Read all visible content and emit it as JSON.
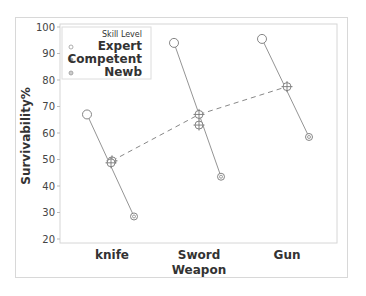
{
  "chart_data": {
    "type": "scatter",
    "title": "",
    "xlabel": "Weapon",
    "ylabel": "Survivability%",
    "ylim": [
      20,
      100
    ],
    "yticks": [
      20,
      30,
      40,
      50,
      60,
      70,
      80,
      90,
      100
    ],
    "categories": [
      "knife",
      "Sword",
      "Gun"
    ],
    "grid": false,
    "legend": {
      "title": "Skill Level",
      "position": "upper-left",
      "entries": [
        "Expert",
        "Competent",
        "Newb"
      ]
    },
    "series": [
      {
        "name": "Expert",
        "marker": "open-circle",
        "values": [
          67,
          94,
          95.5
        ]
      },
      {
        "name": "Competent",
        "marker": "crosshair-circle",
        "values": [
          49.5,
          67,
          77.5
        ]
      },
      {
        "name": "Newb",
        "marker": "small-circle",
        "values": [
          28.5,
          43.5,
          58.5
        ]
      }
    ],
    "extra_points": [
      {
        "category": "Sword",
        "series": "Competent",
        "value": 63
      }
    ],
    "annotations": {
      "solid_lines": "connect Expert to Newb within each weapon",
      "dashed_line": "connects Competent means across weapons"
    }
  },
  "labels": {
    "ylabel": "Survivability%",
    "xlabel": "Weapon",
    "categories": [
      "knife",
      "Sword",
      "Gun"
    ],
    "yticks": [
      "20",
      "30",
      "40",
      "50",
      "60",
      "70",
      "80",
      "90",
      "100"
    ],
    "legend_title": "Skill Level",
    "legend_entries": [
      "Expert",
      "Competent",
      "Newb"
    ]
  },
  "colors": {
    "marker": "#777777",
    "line": "#888888",
    "dashed": "#888888",
    "frame": "#d8d8d8",
    "text": "#333333"
  }
}
